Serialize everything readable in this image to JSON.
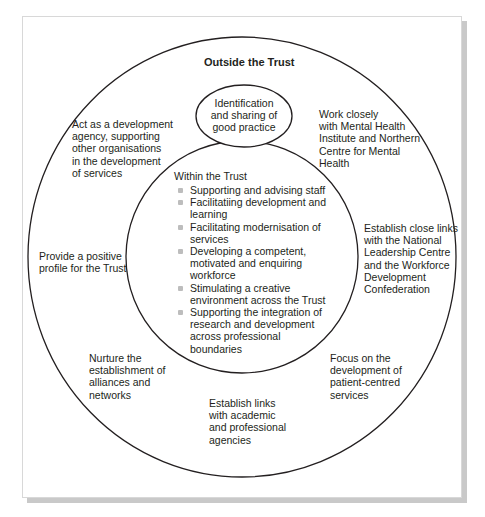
{
  "diagram": {
    "outer_title": "Outside the Trust",
    "center_ellipse": "Identification\nand sharing of\ngood practice",
    "inner": {
      "title": "Within the Trust",
      "items": [
        "Supporting and advising staff",
        "Facilitatiing development and\nlearning",
        "Facilitating modernisation of\nservices",
        "Developing a competent,\nmotivated and enquiring\nworkforce",
        "Stimulating a creative\nenvironment across the Trust",
        "Supporting the integration of\nresearch and development\nacross professional\nboundaries"
      ]
    },
    "outer_items": {
      "top_left": "Act as a development\nagency, supporting\nother organisations\nin the development\nof services",
      "top_right": "Work closely\nwith Mental Health\nInstitute and Northern\nCentre for Mental\nHealth",
      "left": "Provide a positive\nprofile for the Trust",
      "right": "Establish close links\nwith the National\nLeadership Centre\nand the Workforce\nDevelopment\nConfederation",
      "bottom_left": "Nurture the\nestablishment of\nalliances and\nnetworks",
      "bottom": "Establish links\nwith academic\nand professional\nagencies",
      "bottom_right": "Focus on the\ndevelopment of\npatient-centred\nservices"
    },
    "colors": {
      "stroke": "#231f20",
      "bullet": "#bdbdbd",
      "shadow": "#c9c9c9"
    }
  }
}
